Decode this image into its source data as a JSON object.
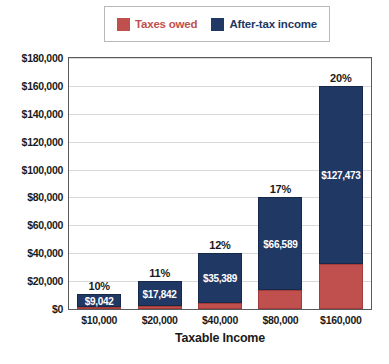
{
  "chart_data": {
    "type": "bar",
    "subtype": "stacked-bar",
    "title": "",
    "xlabel": "Taxable Income",
    "ylabel": "",
    "categories": [
      "$10,000",
      "$20,000",
      "$40,000",
      "$80,000",
      "$160,000"
    ],
    "series": [
      {
        "name": "Taxes owed",
        "color": "#c0504d",
        "values": [
          958,
          2158,
          4611,
          13411,
          32527
        ]
      },
      {
        "name": "After-tax income",
        "color": "#1f3864",
        "values": [
          9042,
          17842,
          35389,
          66589,
          127473
        ]
      }
    ],
    "bar_value_labels": [
      "$9,042",
      "$17,842",
      "$35,389",
      "$66,589",
      "$127,473"
    ],
    "bar_pct_labels": [
      "10%",
      "11%",
      "12%",
      "17%",
      "20%"
    ],
    "totals": [
      10000,
      20000,
      40000,
      80000,
      160000
    ],
    "ylim": [
      0,
      180000
    ],
    "ytick_values": [
      0,
      20000,
      40000,
      60000,
      80000,
      100000,
      120000,
      140000,
      160000,
      180000
    ],
    "ytick_labels": [
      "$0",
      "$20,000",
      "$40,000",
      "$60,000",
      "$80,000",
      "$100,000",
      "$120,000",
      "$140,000",
      "$160,000",
      "$180,000"
    ],
    "grid": true,
    "legend_position": "top"
  },
  "legend": {
    "items": [
      {
        "label": "Taxes owed",
        "color": "#c0504d"
      },
      {
        "label": "After-tax income",
        "color": "#1f3864"
      }
    ]
  },
  "axis": {
    "x_title": "Taxable Income"
  }
}
